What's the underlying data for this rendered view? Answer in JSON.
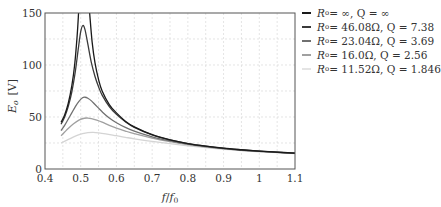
{
  "chart_data": {
    "type": "line",
    "title": "",
    "xlabel": "f/f0",
    "ylabel": "Eo [V]",
    "xlim": [
      0.4,
      1.1
    ],
    "ylim": [
      0,
      150
    ],
    "xticks": [
      0.4,
      0.5,
      0.6,
      0.7,
      0.8,
      0.9,
      1.0,
      1.1
    ],
    "xtick_labels": [
      "0.4",
      "0.5",
      "0.6",
      "0.7",
      "0.8",
      "0.9",
      "1",
      "1.1"
    ],
    "yticks": [
      0,
      50,
      100,
      150
    ],
    "ytick_labels": [
      "0",
      "50",
      "100",
      "150"
    ],
    "grid": true,
    "legend_position": "outside-right-top",
    "series": [
      {
        "name": "Ro = ∞, Q = ∞",
        "label_text": "Rₒ = ∞,  Q = ∞",
        "color": "#1a1a1a",
        "segments": [
          [
            [
              0.445,
              45
            ],
            [
              0.455,
              52
            ],
            [
              0.465,
              63
            ],
            [
              0.475,
              80
            ],
            [
              0.483,
              100
            ],
            [
              0.49,
              128
            ],
            [
              0.494,
              150
            ]
          ],
          [
            [
              0.525,
              150
            ],
            [
              0.532,
              122
            ],
            [
              0.54,
              102
            ],
            [
              0.55,
              86
            ],
            [
              0.56,
              75
            ],
            [
              0.58,
              62
            ],
            [
              0.6,
              54
            ],
            [
              0.625,
              46
            ],
            [
              0.65,
              40.5
            ],
            [
              0.7,
              33
            ],
            [
              0.75,
              28
            ],
            [
              0.8,
              24.5
            ],
            [
              0.85,
              22
            ],
            [
              0.9,
              20
            ],
            [
              0.95,
              18.5
            ],
            [
              1.0,
              17.2
            ],
            [
              1.05,
              16.2
            ],
            [
              1.1,
              15.3
            ]
          ]
        ]
      },
      {
        "name": "Ro = 46.08Ω, Q = 7.38",
        "label_text": "Rₒ = 46.08Ω,  Q = 7.38",
        "color": "#3a3a3a",
        "segments": [
          [
            [
              0.445,
              43
            ],
            [
              0.455,
              50
            ],
            [
              0.465,
              60
            ],
            [
              0.475,
              74
            ],
            [
              0.485,
              94
            ],
            [
              0.493,
              115
            ],
            [
              0.5,
              132
            ],
            [
              0.506,
              138
            ],
            [
              0.512,
              134
            ],
            [
              0.52,
              120
            ],
            [
              0.53,
              102
            ],
            [
              0.54,
              89
            ],
            [
              0.55,
              79
            ],
            [
              0.56,
              71
            ],
            [
              0.58,
              60
            ],
            [
              0.6,
              52.5
            ],
            [
              0.625,
              45.5
            ],
            [
              0.65,
              40
            ],
            [
              0.7,
              32.8
            ],
            [
              0.75,
              27.9
            ],
            [
              0.8,
              24.4
            ],
            [
              0.85,
              21.9
            ],
            [
              0.9,
              19.9
            ],
            [
              0.95,
              18.4
            ],
            [
              1.0,
              17.1
            ],
            [
              1.05,
              16.1
            ],
            [
              1.1,
              15.2
            ]
          ]
        ]
      },
      {
        "name": "Ro = 23.04Ω, Q = 3.69",
        "label_text": "Rₒ = 23.04Ω,  Q = 3.69",
        "color": "#707070",
        "segments": [
          [
            [
              0.445,
              37
            ],
            [
              0.455,
              42
            ],
            [
              0.465,
              48
            ],
            [
              0.475,
              54
            ],
            [
              0.485,
              60
            ],
            [
              0.495,
              65
            ],
            [
              0.505,
              68.5
            ],
            [
              0.512,
              69
            ],
            [
              0.52,
              68
            ],
            [
              0.53,
              65.5
            ],
            [
              0.54,
              62
            ],
            [
              0.55,
              58.5
            ],
            [
              0.56,
              55
            ],
            [
              0.58,
              49
            ],
            [
              0.6,
              44.5
            ],
            [
              0.625,
              40
            ],
            [
              0.65,
              36.5
            ],
            [
              0.7,
              31
            ],
            [
              0.75,
              27
            ],
            [
              0.8,
              23.9
            ],
            [
              0.85,
              21.6
            ],
            [
              0.9,
              19.7
            ],
            [
              0.95,
              18.2
            ],
            [
              1.0,
              17
            ],
            [
              1.05,
              16
            ],
            [
              1.1,
              15.1
            ]
          ]
        ]
      },
      {
        "name": "Ro = 16.0Ω, Q = 2.56",
        "label_text": "Rₒ = 16.0Ω,  Q = 2.56",
        "color": "#a0a0a0",
        "segments": [
          [
            [
              0.445,
              32
            ],
            [
              0.455,
              35.5
            ],
            [
              0.465,
              39
            ],
            [
              0.48,
              43.5
            ],
            [
              0.495,
              47
            ],
            [
              0.51,
              48.8
            ],
            [
              0.52,
              49
            ],
            [
              0.53,
              48.5
            ],
            [
              0.545,
              47
            ],
            [
              0.56,
              45
            ],
            [
              0.58,
              42
            ],
            [
              0.6,
              39.3
            ],
            [
              0.625,
              36.5
            ],
            [
              0.65,
              34
            ],
            [
              0.7,
              29.8
            ],
            [
              0.75,
              26.3
            ],
            [
              0.8,
              23.5
            ],
            [
              0.85,
              21.3
            ],
            [
              0.9,
              19.5
            ],
            [
              0.95,
              18
            ],
            [
              1.0,
              16.9
            ],
            [
              1.05,
              15.9
            ],
            [
              1.1,
              15
            ]
          ]
        ]
      },
      {
        "name": "Ro = 11.52Ω, Q = 1.846",
        "label_text": "Rₒ = 11.52Ω,  Q = 1.846",
        "color": "#d4d4d4",
        "segments": [
          [
            [
              0.445,
              25
            ],
            [
              0.46,
              27.5
            ],
            [
              0.475,
              30
            ],
            [
              0.49,
              32.3
            ],
            [
              0.505,
              34
            ],
            [
              0.52,
              35
            ],
            [
              0.535,
              35.2
            ],
            [
              0.55,
              34.8
            ],
            [
              0.57,
              33.8
            ],
            [
              0.6,
              32
            ],
            [
              0.625,
              30.5
            ],
            [
              0.65,
              29
            ],
            [
              0.7,
              26.5
            ],
            [
              0.75,
              24.3
            ],
            [
              0.8,
              22.3
            ],
            [
              0.85,
              20.6
            ],
            [
              0.9,
              19
            ],
            [
              0.95,
              17.7
            ],
            [
              1.0,
              16.6
            ],
            [
              1.05,
              15.7
            ],
            [
              1.1,
              14.9
            ]
          ]
        ]
      }
    ]
  },
  "axes": {
    "xlabel_main": "f",
    "xlabel_sep": "/",
    "xlabel_sub": "f",
    "xlabel_subscript": "0",
    "ylabel_main": "E",
    "ylabel_subscript": "o",
    "ylabel_unit": "[V]"
  },
  "legend": {
    "items": [
      {
        "r_label": "R",
        "r_sub": "o",
        "text": " = ∞,  Q = ∞"
      },
      {
        "r_label": "R",
        "r_sub": "o",
        "text": " = 46.08Ω,  Q = 7.38"
      },
      {
        "r_label": "R",
        "r_sub": "o",
        "text": " = 23.04Ω,  Q = 3.69"
      },
      {
        "r_label": "R",
        "r_sub": "o",
        "text": " = 16.0Ω,  Q = 2.56"
      },
      {
        "r_label": "R",
        "r_sub": "o",
        "text": " = 11.52Ω,  Q = 1.846"
      }
    ]
  }
}
